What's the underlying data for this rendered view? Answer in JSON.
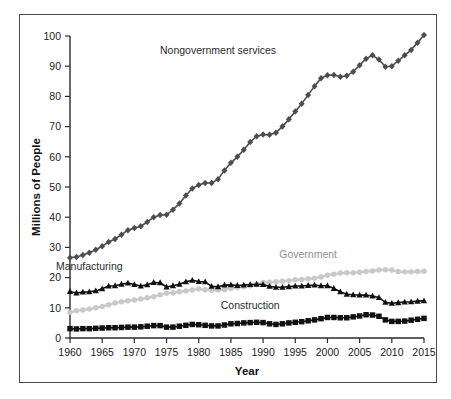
{
  "chart_data": {
    "type": "line",
    "title": "",
    "xlabel": "Year",
    "ylabel": "Millions of People",
    "xlim": [
      1960,
      2015
    ],
    "ylim": [
      0,
      100
    ],
    "xticks": [
      1960,
      1965,
      1970,
      1975,
      1980,
      1985,
      1990,
      1995,
      2000,
      2005,
      2010,
      2015
    ],
    "yticks": [
      0,
      10,
      20,
      30,
      40,
      50,
      60,
      70,
      80,
      90,
      100
    ],
    "grid": false,
    "legend_position": "inline-annotations",
    "x": [
      1960,
      1961,
      1962,
      1963,
      1964,
      1965,
      1966,
      1967,
      1968,
      1969,
      1970,
      1971,
      1972,
      1973,
      1974,
      1975,
      1976,
      1977,
      1978,
      1979,
      1980,
      1981,
      1982,
      1983,
      1984,
      1985,
      1986,
      1987,
      1988,
      1989,
      1990,
      1991,
      1992,
      1993,
      1994,
      1995,
      1996,
      1997,
      1998,
      1999,
      2000,
      2001,
      2002,
      2003,
      2004,
      2005,
      2006,
      2007,
      2008,
      2009,
      2010,
      2011,
      2012,
      2013,
      2014,
      2015
    ],
    "series": [
      {
        "name": "Nongovernment services",
        "marker": "diamond",
        "color": "#4d4d4d",
        "label_x": 1983,
        "label_y": 94,
        "values": [
          26.6,
          26.8,
          27.5,
          28.2,
          29.2,
          30.4,
          31.8,
          32.8,
          34.2,
          35.7,
          36.4,
          37.0,
          38.4,
          40.0,
          40.7,
          40.8,
          42.5,
          44.5,
          47.2,
          49.5,
          50.7,
          51.3,
          51.3,
          52.6,
          55.5,
          58.0,
          60.0,
          62.3,
          64.9,
          66.8,
          67.4,
          67.3,
          68.0,
          70.0,
          72.4,
          75.0,
          77.6,
          80.5,
          83.4,
          86.0,
          87.0,
          87.1,
          86.5,
          86.8,
          88.2,
          90.3,
          92.5,
          93.6,
          92.2,
          89.8,
          90.0,
          91.8,
          93.6,
          95.4,
          97.8,
          100.3
        ]
      },
      {
        "name": "Manufacturing",
        "marker": "triangle",
        "color": "#111111",
        "label_x": 1963,
        "label_y": 22.5,
        "values": [
          15.4,
          14.9,
          15.2,
          15.3,
          15.6,
          16.3,
          17.2,
          17.3,
          17.8,
          18.2,
          17.7,
          17.2,
          17.6,
          18.4,
          18.3,
          16.9,
          17.3,
          17.8,
          18.6,
          19.1,
          18.7,
          18.6,
          17.1,
          17.0,
          17.5,
          17.6,
          17.4,
          17.5,
          17.7,
          17.8,
          17.7,
          17.1,
          16.8,
          16.8,
          17.0,
          17.2,
          17.2,
          17.4,
          17.5,
          17.3,
          17.3,
          16.4,
          15.3,
          14.5,
          14.3,
          14.2,
          14.2,
          13.9,
          13.4,
          11.8,
          11.5,
          11.7,
          11.9,
          12.0,
          12.2,
          12.3
        ]
      },
      {
        "name": "Government",
        "marker": "circle",
        "color": "#c9c9c9",
        "label_x": 1997,
        "label_y": 26.5,
        "values": [
          8.5,
          9.0,
          9.3,
          9.6,
          10.0,
          10.4,
          11.0,
          11.6,
          12.0,
          12.3,
          12.6,
          12.9,
          13.3,
          13.7,
          14.3,
          14.8,
          15.0,
          15.3,
          15.6,
          15.9,
          16.2,
          16.0,
          15.8,
          15.9,
          16.0,
          16.4,
          16.7,
          17.0,
          17.3,
          17.7,
          18.4,
          18.5,
          18.6,
          18.8,
          19.0,
          19.3,
          19.4,
          19.6,
          19.8,
          20.2,
          20.8,
          21.1,
          21.5,
          21.6,
          21.6,
          21.8,
          22.0,
          22.2,
          22.5,
          22.6,
          22.5,
          22.0,
          21.9,
          21.9,
          22.0,
          22.1
        ]
      },
      {
        "name": "Construction",
        "marker": "square",
        "color": "#111111",
        "label_x": 1988,
        "label_y": 9.5,
        "values": [
          3.1,
          3.0,
          3.1,
          3.1,
          3.2,
          3.3,
          3.4,
          3.4,
          3.5,
          3.6,
          3.6,
          3.7,
          3.9,
          4.1,
          4.1,
          3.6,
          3.6,
          3.9,
          4.2,
          4.5,
          4.4,
          4.2,
          4.0,
          4.0,
          4.3,
          4.7,
          4.8,
          5.0,
          5.1,
          5.2,
          5.1,
          4.7,
          4.5,
          4.7,
          5.0,
          5.2,
          5.4,
          5.7,
          6.0,
          6.4,
          6.8,
          6.8,
          6.7,
          6.7,
          7.0,
          7.3,
          7.7,
          7.6,
          7.2,
          6.0,
          5.5,
          5.5,
          5.6,
          5.9,
          6.2,
          6.5
        ]
      }
    ]
  }
}
